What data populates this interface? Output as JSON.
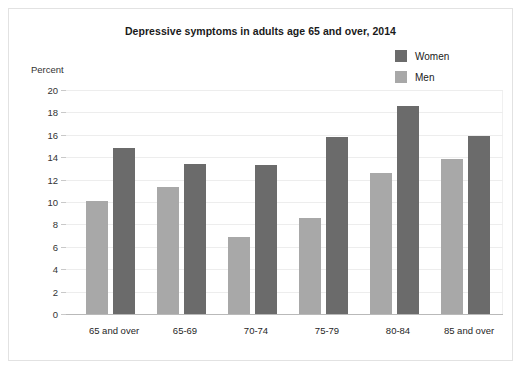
{
  "chart_data": {
    "type": "bar",
    "title": "Depressive symptoms in adults age 65 and over, 2014",
    "xlabel": "",
    "ylabel": "Percent",
    "ylim": [
      0,
      20
    ],
    "ytick_step": 2,
    "yticks": [
      "20",
      "18",
      "16",
      "14",
      "12",
      "10",
      "8",
      "6",
      "4",
      "2",
      "0"
    ],
    "grid": true,
    "legend_position": "top-right",
    "categories": [
      "65 and over",
      "65-69",
      "70-74",
      "75-79",
      "80-84",
      "85 and over"
    ],
    "series": [
      {
        "name": "Women",
        "color": "#6b6b6b",
        "values": [
          14.8,
          13.4,
          13.3,
          15.8,
          18.6,
          15.9
        ]
      },
      {
        "name": "Men",
        "color": "#a8a8a8",
        "values": [
          10.1,
          11.3,
          6.9,
          8.6,
          12.6,
          13.8
        ]
      }
    ]
  }
}
